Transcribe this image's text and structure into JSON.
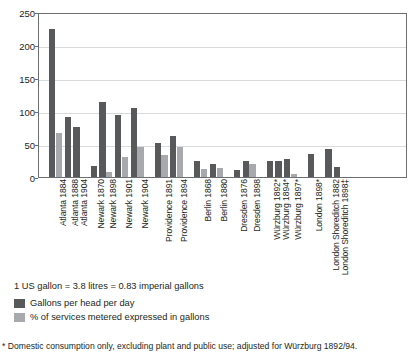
{
  "chart_data": {
    "type": "bar",
    "title": "",
    "xlabel": "",
    "ylabel": "US gallons per head per day",
    "ylim": [
      0,
      250
    ],
    "yticks": [
      0,
      50,
      100,
      150,
      200,
      250
    ],
    "grid": true,
    "legend_position": "below-left",
    "categories": [
      "Atlanta 1884",
      "Atlanta 1888",
      "Atlanta 1904",
      "Newark 1870",
      "Newark 1898",
      "Newark 1901",
      "Newark 1904",
      "Providence 1891",
      "Providence 1894",
      "Berlin 1868",
      "Berlin 1880",
      "Dresden 1876",
      "Dresden 1898",
      "Würzburg 1892*",
      "Würzburg 1894*",
      "Würzburg 1897*",
      "London 1898*",
      "London Shoreditch 1882",
      "London Shoreditch 1898‡"
    ],
    "series": [
      {
        "name": "Gallons per head per day",
        "color": "#58595b",
        "values": [
          225,
          91,
          76,
          17,
          113,
          94,
          105,
          51,
          62,
          24,
          20,
          10,
          25,
          25,
          24,
          28,
          35,
          43,
          15
        ]
      },
      {
        "name": "% of services metered expressed in gallons",
        "color": "#a7a9ac",
        "values": [
          67,
          0,
          0,
          0,
          8,
          31,
          45,
          33,
          45,
          12,
          14,
          0,
          19,
          0,
          0,
          4,
          0,
          0,
          0
        ]
      }
    ],
    "group_breaks_after": [
      "Atlanta 1904",
      "Newark 1904",
      "Providence 1894",
      "Berlin 1880",
      "Dresden 1898",
      "Würzburg 1897*",
      "London 1898*"
    ]
  },
  "axis": {
    "y_title": "US gallons per head per day",
    "y_tick_labels": [
      "250",
      "200",
      "150",
      "100",
      "50",
      "0"
    ]
  },
  "legend": {
    "items": [
      {
        "label": "Gallons per head per day",
        "color": "#58595b"
      },
      {
        "label": "% of services metered expressed in gallons",
        "color": "#a7a9ac"
      }
    ]
  },
  "notes": {
    "conversion": "1 US gallon = 3.8 litres = 0.83 imperial gallons",
    "footnote": "* Domestic consumption only, excluding plant and public use; adjusted for Würzburg 1892/94."
  },
  "colors": {
    "bar_dark": "#58595b",
    "bar_light": "#a7a9ac",
    "gridline": "#d9dadb",
    "axis": "#6d6e71",
    "text": "#231f20",
    "background": "#ffffff"
  }
}
